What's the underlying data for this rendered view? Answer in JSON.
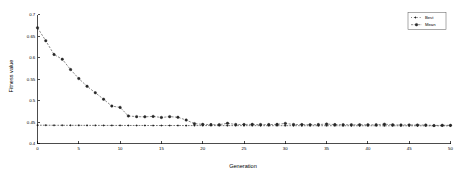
{
  "chart_data": {
    "type": "line",
    "title": "",
    "xlabel": "Generation",
    "ylabel": "Fitness value",
    "xlim": [
      0,
      50
    ],
    "ylim": [
      0.4,
      0.7
    ],
    "xticks": [
      0,
      5,
      10,
      15,
      20,
      25,
      30,
      35,
      40,
      45,
      50
    ],
    "xticklabels": [
      "0",
      "5",
      "10",
      "15",
      "20",
      "25",
      "30",
      "35",
      "40",
      "45",
      "50"
    ],
    "yticks": [
      0.4,
      0.45,
      0.5,
      0.55,
      0.6,
      0.65,
      0.7
    ],
    "yticklabels": [
      "0.4",
      "0.45",
      "0.5",
      "0.55",
      "0.6",
      "0.65",
      "0.7"
    ],
    "grid": false,
    "legend_position": "upper right",
    "x": [
      0,
      1,
      2,
      3,
      4,
      5,
      6,
      7,
      8,
      9,
      10,
      11,
      12,
      13,
      14,
      15,
      16,
      17,
      18,
      19,
      20,
      21,
      22,
      23,
      24,
      25,
      26,
      27,
      28,
      29,
      30,
      31,
      32,
      33,
      34,
      35,
      36,
      37,
      38,
      39,
      40,
      41,
      42,
      43,
      44,
      45,
      46,
      47,
      48,
      49,
      50
    ],
    "series": [
      {
        "name": "Best",
        "marker": "dot",
        "linestyle": "dotted",
        "color": "#1a1a1a",
        "values": [
          0.4425,
          0.4425,
          0.4423,
          0.4423,
          0.4422,
          0.4422,
          0.4421,
          0.4421,
          0.442,
          0.442,
          0.442,
          0.4419,
          0.4419,
          0.4419,
          0.4418,
          0.4418,
          0.4418,
          0.4418,
          0.4417,
          0.4417,
          0.4417,
          0.4417,
          0.4416,
          0.4416,
          0.4416,
          0.4416,
          0.4416,
          0.4415,
          0.4415,
          0.4415,
          0.4415,
          0.4415,
          0.4414,
          0.4414,
          0.4414,
          0.4414,
          0.4414,
          0.4413,
          0.4413,
          0.4413,
          0.4413,
          0.4413,
          0.4412,
          0.4412,
          0.4412,
          0.4412,
          0.4412,
          0.4411,
          0.4411,
          0.4411,
          0.4411
        ]
      },
      {
        "name": "Mean",
        "marker": "circle",
        "linestyle": "dashed",
        "color": "#2b2b2b",
        "values": [
          0.669,
          0.639,
          0.607,
          0.596,
          0.572,
          0.551,
          0.533,
          0.518,
          0.503,
          0.487,
          0.484,
          0.464,
          0.4625,
          0.462,
          0.463,
          0.4605,
          0.4625,
          0.461,
          0.4545,
          0.4462,
          0.4445,
          0.444,
          0.4438,
          0.447,
          0.4442,
          0.4442,
          0.4445,
          0.444,
          0.444,
          0.4445,
          0.4468,
          0.4442,
          0.444,
          0.4438,
          0.444,
          0.4452,
          0.444,
          0.4438,
          0.4436,
          0.4436,
          0.4434,
          0.4436,
          0.445,
          0.4434,
          0.4432,
          0.4432,
          0.443,
          0.443,
          0.4418,
          0.4424,
          0.4422
        ]
      }
    ]
  },
  "legend": {
    "entries": [
      {
        "label": "Best"
      },
      {
        "label": "Mean"
      }
    ]
  }
}
